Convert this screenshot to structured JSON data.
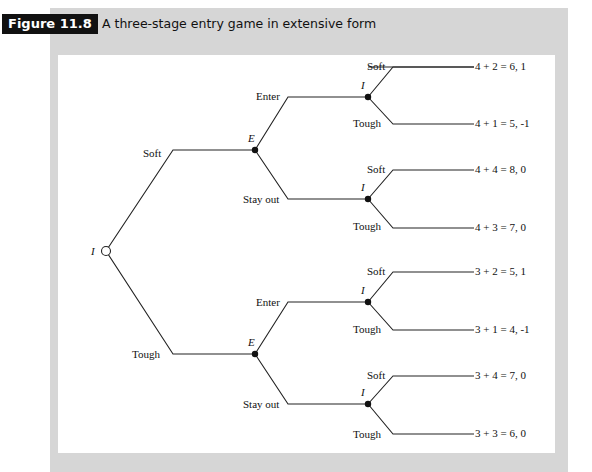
{
  "figure": {
    "badge": "Figure 11.8",
    "title": "A three-stage entry game in extensive form"
  },
  "tree": {
    "root": {
      "label": "I"
    },
    "stage1_moves": {
      "upper": "Soft",
      "lower": "Tough"
    },
    "entrant_nodes": [
      {
        "label": "E",
        "moves": {
          "upper": "Enter",
          "lower": "Stay out"
        }
      },
      {
        "label": "E",
        "moves": {
          "upper": "Enter",
          "lower": "Stay out"
        }
      }
    ],
    "incumbent_nodes": [
      {
        "label": "I",
        "moves": {
          "upper": "Soft",
          "lower": "Tough"
        }
      },
      {
        "label": "I",
        "moves": {
          "upper": "Soft",
          "lower": "Tough"
        }
      },
      {
        "label": "I",
        "moves": {
          "upper": "Soft",
          "lower": "Tough"
        }
      },
      {
        "label": "I",
        "moves": {
          "upper": "Soft",
          "lower": "Tough"
        }
      }
    ],
    "payoffs": [
      "4 + 2 = 6, 1",
      "4 + 1 = 5, -1",
      "4 + 4 = 8, 0",
      "4 + 3 = 7, 0",
      "3 + 2 = 5, 1",
      "3 + 1 = 4, -1",
      "3 + 4 = 7, 0",
      "3 + 3 = 6, 0"
    ]
  }
}
